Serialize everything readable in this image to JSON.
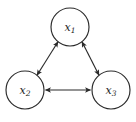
{
  "diagram": {
    "type": "directed-graph",
    "title": "",
    "background_color": "#ffffff",
    "stroke_color": "#2b2b2b",
    "label_color": "#1c1c1c",
    "nodes": [
      {
        "id": "x1",
        "base": "x",
        "subscript": "1",
        "cx": 70,
        "cy": 27,
        "r": 19
      },
      {
        "id": "x2",
        "base": "x",
        "subscript": "2",
        "cx": 25,
        "cy": 90,
        "r": 19
      },
      {
        "id": "x3",
        "base": "x",
        "subscript": "3",
        "cx": 111,
        "cy": 90,
        "r": 19
      }
    ],
    "edges": [
      {
        "id": "edge-x1-x2",
        "from": "x1",
        "to": "x2",
        "direction": "bidirectional"
      },
      {
        "id": "edge-x1-x3",
        "from": "x1",
        "to": "x3",
        "direction": "bidirectional"
      },
      {
        "id": "edge-x2-x3",
        "from": "x2",
        "to": "x3",
        "direction": "bidirectional"
      }
    ]
  }
}
